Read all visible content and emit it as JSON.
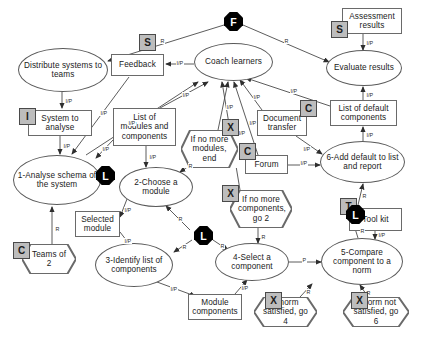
{
  "diagram": {
    "colors": {
      "badge_fill": "#bdbdbd",
      "badge_stroke": "#4a4a4a",
      "octagon_fill": "#000000",
      "node_stroke": "#5a5a5a",
      "background": "#ffffff",
      "text": "#1a1a1a"
    },
    "nodes": [
      {
        "id": "distribute",
        "shape": "ellipse",
        "label": "Distribute systems to teams",
        "x": 18,
        "y": 48,
        "w": 90,
        "h": 44
      },
      {
        "id": "system",
        "shape": "rect",
        "label": "System to analyse",
        "x": 28,
        "y": 110,
        "w": 64,
        "h": 26
      },
      {
        "id": "analyse",
        "shape": "ellipse",
        "label": "1-Analyse schema of the system",
        "x": 13,
        "y": 155,
        "w": 88,
        "h": 50
      },
      {
        "id": "teams",
        "shape": "hex",
        "label": "Teams of 2",
        "x": 22,
        "y": 244,
        "w": 54,
        "h": 30
      },
      {
        "id": "feedback",
        "shape": "rect",
        "label": "Feedback",
        "x": 111,
        "y": 54,
        "w": 53,
        "h": 22
      },
      {
        "id": "list_modules",
        "shape": "rect",
        "label": "List of modules and components",
        "x": 113,
        "y": 108,
        "w": 63,
        "h": 38
      },
      {
        "id": "choose",
        "shape": "ellipse",
        "label": "2-Choose a module",
        "x": 119,
        "y": 167,
        "w": 74,
        "h": 40
      },
      {
        "id": "selected",
        "shape": "rect",
        "label": "Selected module",
        "x": 75,
        "y": 211,
        "w": 45,
        "h": 26
      },
      {
        "id": "identify",
        "shape": "ellipse",
        "label": "3-Identify list of components",
        "x": 95,
        "y": 243,
        "w": 78,
        "h": 44
      },
      {
        "id": "module_comp",
        "shape": "rect",
        "label": "Module components",
        "x": 188,
        "y": 294,
        "w": 54,
        "h": 26
      },
      {
        "id": "coach",
        "shape": "ellipse",
        "label": "Coach learners",
        "x": 194,
        "y": 43,
        "w": 79,
        "h": 38
      },
      {
        "id": "no_modules",
        "shape": "hex",
        "label": "If no more modules, end",
        "x": 181,
        "y": 130,
        "w": 57,
        "h": 38
      },
      {
        "id": "document",
        "shape": "rect",
        "label": "Document transfer",
        "x": 257,
        "y": 110,
        "w": 50,
        "h": 26
      },
      {
        "id": "forum",
        "shape": "rect",
        "label": "Forum",
        "x": 245,
        "y": 155,
        "w": 43,
        "h": 19
      },
      {
        "id": "no_components",
        "shape": "hex",
        "label": "If no more components, go 2",
        "x": 230,
        "y": 190,
        "w": 62,
        "h": 38
      },
      {
        "id": "select_comp",
        "shape": "ellipse",
        "label": "4-Select a component",
        "x": 215,
        "y": 243,
        "w": 74,
        "h": 38
      },
      {
        "id": "norm_sat",
        "shape": "hex",
        "label": "If norm satisfied, go 4",
        "x": 254,
        "y": 297,
        "w": 63,
        "h": 30
      },
      {
        "id": "assessment",
        "shape": "rect",
        "label": "Assessment results",
        "x": 342,
        "y": 8,
        "w": 60,
        "h": 26
      },
      {
        "id": "evaluate",
        "shape": "ellipse",
        "label": "Evaluate results",
        "x": 326,
        "y": 50,
        "w": 76,
        "h": 36
      },
      {
        "id": "list_default",
        "shape": "rect",
        "label": "List of default components",
        "x": 330,
        "y": 100,
        "w": 67,
        "h": 26
      },
      {
        "id": "add_default",
        "shape": "ellipse",
        "label": "6-Add default to list and report",
        "x": 320,
        "y": 141,
        "w": 85,
        "h": 42
      },
      {
        "id": "tool_kit",
        "shape": "rect",
        "label": "Tool kit",
        "x": 349,
        "y": 208,
        "w": 53,
        "h": 23
      },
      {
        "id": "compare",
        "shape": "ellipse",
        "label": "5-Compare component to a norm",
        "x": 321,
        "y": 238,
        "w": 82,
        "h": 47
      },
      {
        "id": "norm_not_sat",
        "shape": "hex",
        "label": "If norm not satisfied, go 6",
        "x": 343,
        "y": 297,
        "w": 66,
        "h": 30
      }
    ],
    "badges": [
      {
        "id": "badge-i-system",
        "letter": "I",
        "x": 19,
        "y": 108
      },
      {
        "id": "badge-c-teams",
        "letter": "C",
        "x": 13,
        "y": 242
      },
      {
        "id": "badge-s-feedback",
        "letter": "S",
        "x": 139,
        "y": 34
      },
      {
        "id": "badge-x-no-modules",
        "letter": "X",
        "x": 222,
        "y": 119
      },
      {
        "id": "badge-c-document",
        "letter": "C",
        "x": 300,
        "y": 100
      },
      {
        "id": "badge-c-forum",
        "letter": "C",
        "x": 239,
        "y": 143
      },
      {
        "id": "badge-x-no-components",
        "letter": "X",
        "x": 222,
        "y": 185
      },
      {
        "id": "badge-s-assessment",
        "letter": "S",
        "x": 331,
        "y": 21
      },
      {
        "id": "badge-t-toolkit",
        "letter": "T",
        "x": 340,
        "y": 198
      },
      {
        "id": "badge-x-norm-sat",
        "letter": "X",
        "x": 265,
        "y": 292
      },
      {
        "id": "badge-x-norm-not-sat",
        "letter": "X",
        "x": 351,
        "y": 292
      }
    ],
    "octagons": [
      {
        "id": "octagon-f-coach",
        "letter": "F",
        "x": 224,
        "y": 12
      },
      {
        "id": "octagon-l-analyse",
        "letter": "L",
        "x": 96,
        "y": 166
      },
      {
        "id": "octagon-l-identify",
        "letter": "L",
        "x": 194,
        "y": 226
      },
      {
        "id": "octagon-l-compare",
        "letter": "L",
        "x": 346,
        "y": 205
      }
    ],
    "edges": [
      {
        "from": "coach",
        "to": "distribute",
        "label": "R",
        "path": "M 224,25 L 108,61",
        "lx": 160,
        "ly": 38
      },
      {
        "from": "coach",
        "to": "evaluate",
        "label": "R",
        "path": "M 243,25 L 329,62",
        "lx": 284,
        "ly": 38
      },
      {
        "from": "coach",
        "to": "feedback",
        "label": "I/P",
        "path": "M 194,64 L 166,64",
        "lx": 176,
        "ly": 60
      },
      {
        "from": "distribute",
        "to": "system",
        "label": "I/P",
        "path": "M 62,92 L 62,108",
        "lx": 65,
        "ly": 98
      },
      {
        "from": "system",
        "to": "analyse",
        "label": "I/P",
        "path": "M 60,136 L 60,154",
        "lx": 63,
        "ly": 143
      },
      {
        "from": "teams",
        "to": "analyse",
        "label": "R",
        "path": "M 52,244 L 52,207",
        "lx": 55,
        "ly": 226
      },
      {
        "from": "feedback",
        "to": "analyse",
        "label": "I/P",
        "path": "M 129,77 L 72,154",
        "lx": 100,
        "ly": 110
      },
      {
        "from": "analyse",
        "to": "coach",
        "label": "I/P",
        "path": "M 86,155 L 198,82",
        "lx": 128,
        "ly": 120
      },
      {
        "from": "list_modules",
        "to": "coach",
        "label": "I/P",
        "path": "M 160,108 L 208,82",
        "lx": 182,
        "ly": 92
      },
      {
        "from": "list_modules",
        "to": "analyse",
        "label": "I/P",
        "path": "M 113,140 L 96,158",
        "lx": 102,
        "ly": 146
      },
      {
        "from": "list_modules",
        "to": "choose",
        "label": "I/P",
        "path": "M 146,146 L 146,167",
        "lx": 149,
        "ly": 154
      },
      {
        "from": "no_modules",
        "to": "choose",
        "label": "R",
        "path": "M 192,164 L 180,172",
        "lx": 188,
        "ly": 163
      },
      {
        "from": "no_modules",
        "to": "coach",
        "label": "I/P",
        "path": "M 218,130 L 228,82",
        "lx": 226,
        "ly": 104
      },
      {
        "from": "choose",
        "to": "selected",
        "label": "I/P",
        "path": "M 127,199 L 120,217",
        "lx": 124,
        "ly": 207
      },
      {
        "from": "selected",
        "to": "identify",
        "label": "I/P",
        "path": "M 120,232 L 130,245",
        "lx": 124,
        "ly": 238
      },
      {
        "from": "identify",
        "to": "module_comp",
        "label": "I/P",
        "path": "M 157,282 L 195,296",
        "lx": 170,
        "ly": 286
      },
      {
        "from": "module_comp",
        "to": "select_comp",
        "label": "I/P",
        "path": "M 235,294 L 247,280",
        "lx": 241,
        "ly": 285
      },
      {
        "from": "identify",
        "to": "choose",
        "label": "R",
        "path": "M 190,230 L 166,206",
        "lx": 178,
        "ly": 216
      },
      {
        "from": "identify",
        "to": "octagon-l-2",
        "label": "R",
        "path": "M 192,240 L 174,252",
        "lx": 182,
        "ly": 244
      },
      {
        "from": "octagon-l-2",
        "to": "select_comp",
        "label": "R",
        "path": "M 213,240 L 228,250",
        "lx": 220,
        "ly": 243
      },
      {
        "from": "no_components",
        "to": "select_comp",
        "label": "R",
        "path": "M 258,228 L 258,243",
        "lx": 261,
        "ly": 234
      },
      {
        "from": "no_components",
        "to": "coach",
        "label": "I/P",
        "path": "M 240,190 L 222,82",
        "lx": 238,
        "ly": 130
      },
      {
        "from": "select_comp",
        "to": "compare",
        "label": "P",
        "path": "M 289,262 L 321,262",
        "lx": 302,
        "ly": 257
      },
      {
        "from": "norm_sat",
        "to": "compare",
        "label": "R",
        "path": "M 300,297 L 312,284",
        "lx": 306,
        "ly": 289
      },
      {
        "from": "norm_not_sat",
        "to": "compare",
        "label": "R",
        "path": "M 368,297 L 360,285",
        "lx": 366,
        "ly": 290
      },
      {
        "from": "tool_kit",
        "to": "compare",
        "label": "I/P",
        "path": "M 375,231 L 375,239",
        "lx": 378,
        "ly": 232
      },
      {
        "from": "compare",
        "to": "add_default",
        "label": "R",
        "path": "M 358,238 L 353,222",
        "lx": 360,
        "ly": 228
      },
      {
        "from": "octagon-l-3",
        "to": "add_default",
        "label": "R",
        "path": "M 358,205 L 363,184",
        "lx": 362,
        "ly": 193
      },
      {
        "from": "forum",
        "to": "add_default",
        "label": "I/P",
        "path": "M 288,165 L 320,165",
        "lx": 300,
        "ly": 160
      },
      {
        "from": "forum",
        "to": "coach",
        "label": "I/P",
        "path": "M 258,155 L 234,82",
        "lx": 249,
        "ly": 120
      },
      {
        "from": "document",
        "to": "coach",
        "label": "I/P",
        "path": "M 262,110 L 240,80",
        "lx": 253,
        "ly": 94
      },
      {
        "from": "document",
        "to": "add_default",
        "label": "I/P",
        "path": "M 296,136 L 322,154",
        "lx": 303,
        "ly": 146
      },
      {
        "from": "add_default",
        "to": "list_default",
        "label": "I/P",
        "path": "M 363,141 L 363,127",
        "lx": 366,
        "ly": 132
      },
      {
        "from": "list_default",
        "to": "evaluate",
        "label": "I/P",
        "path": "M 363,100 L 363,87",
        "lx": 366,
        "ly": 92
      },
      {
        "from": "list_default",
        "to": "coach",
        "label": "I/P",
        "path": "M 330,106 L 246,78",
        "lx": 290,
        "ly": 88
      },
      {
        "from": "assessment",
        "to": "evaluate",
        "label": "I/P",
        "path": "M 363,34 L 363,50",
        "lx": 366,
        "ly": 40
      }
    ]
  }
}
